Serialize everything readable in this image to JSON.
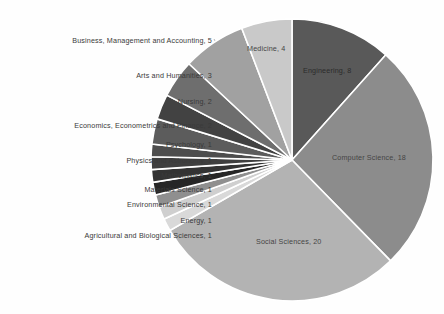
{
  "chart_data": {
    "type": "pie",
    "title": "",
    "subtitle": "",
    "xlabel": "",
    "ylabel": "",
    "grid": false,
    "legend_position": "none",
    "label_format": "name, value",
    "start_angle_deg": 0,
    "direction": "clockwise",
    "total": 50,
    "categories": [
      "Engineering",
      "Computer Science",
      "Social Sciences",
      "Agricultural and Biological Sciences",
      "Energy",
      "Environmental Science",
      "Materials Science",
      "Mathematics",
      "Physics and Astronomy",
      "Psychology",
      "Economics, Econometrics and Finance",
      "Nursing",
      "Arts and Humanities",
      "Business, Management and Accounting",
      "Medicine"
    ],
    "values": [
      8,
      18,
      20,
      1,
      1,
      1,
      1,
      1,
      1,
      1,
      2,
      2,
      3,
      5,
      4
    ],
    "colors": [
      "#595959",
      "#8c8c8c",
      "#b3b3b3",
      "#d9d9d9",
      "#cfcfcf",
      "#8f8f8f",
      "#262626",
      "#333333",
      "#3f3f3f",
      "#4d4d4d",
      "#5c5c5c",
      "#424242",
      "#6e6e6e",
      "#a1a1a1",
      "#c9c9c9"
    ],
    "slice_labels": [
      {
        "text": "Engineering, 8",
        "placement": "inside",
        "tone": "on-dark",
        "left": 303,
        "top": 66
      },
      {
        "text": "Computer Science, 18",
        "placement": "inside",
        "tone": "on-light",
        "left": 332,
        "top": 153
      },
      {
        "text": "Social Sciences, 20",
        "placement": "inside",
        "tone": "on-light",
        "left": 256,
        "top": 237
      },
      {
        "text": "Agricultural and Biological Sciences, 1",
        "placement": "outside",
        "right": 212,
        "top": 231
      },
      {
        "text": "Energy, 1",
        "placement": "outside",
        "right": 212,
        "top": 216
      },
      {
        "text": "Environmental Science, 1",
        "placement": "outside",
        "right": 212,
        "top": 200
      },
      {
        "text": "Materials Science, 1",
        "placement": "outside",
        "right": 212,
        "top": 185
      },
      {
        "text": "Mathematics, 1",
        "placement": "outside",
        "right": 212,
        "top": 171
      },
      {
        "text": "Physics and Astronomy, 1",
        "placement": "outside",
        "right": 212,
        "top": 156
      },
      {
        "text": "Psychology, 1",
        "placement": "outside",
        "right": 212,
        "top": 140
      },
      {
        "text": "Economics, Econometrics and Finance, 2",
        "placement": "outside",
        "right": 212,
        "top": 121
      },
      {
        "text": "Nursing, 2",
        "placement": "outside",
        "right": 212,
        "top": 97
      },
      {
        "text": "Arts and Humanities, 3",
        "placement": "outside",
        "right": 212,
        "top": 71
      },
      {
        "text": "Business, Management and Accounting, 5",
        "placement": "outside",
        "right": 212,
        "top": 36
      },
      {
        "text": "Medicine, 4",
        "placement": "inside",
        "tone": "on-light",
        "left": 247,
        "top": 44
      }
    ],
    "leader_lines": [
      {
        "x1": 214,
        "y1": 234,
        "x2": 239,
        "y2": 234
      },
      {
        "x1": 214,
        "y1": 219,
        "x2": 232,
        "y2": 222
      },
      {
        "x1": 214,
        "y1": 203,
        "x2": 228,
        "y2": 208
      },
      {
        "x1": 214,
        "y1": 188,
        "x2": 225,
        "y2": 196
      },
      {
        "x1": 214,
        "y1": 174,
        "x2": 222,
        "y2": 183
      },
      {
        "x1": 214,
        "y1": 159,
        "x2": 220,
        "y2": 170
      },
      {
        "x1": 214,
        "y1": 143,
        "x2": 219,
        "y2": 157
      },
      {
        "x1": 214,
        "y1": 124,
        "x2": 219,
        "y2": 143
      },
      {
        "x1": 214,
        "y1": 100,
        "x2": 222,
        "y2": 126
      },
      {
        "x1": 214,
        "y1": 74,
        "x2": 228,
        "y2": 107
      },
      {
        "x1": 214,
        "y1": 39,
        "x2": 239,
        "y2": 84
      }
    ]
  },
  "geometry": {
    "center_x": 292,
    "center_y": 160,
    "radius": 141
  },
  "style": {
    "background": "#fefefe",
    "slice_stroke": "#ffffff",
    "slice_stroke_width": 1.6,
    "leader_color": "#9a9a9a",
    "label_color": "#3a3a3a"
  }
}
